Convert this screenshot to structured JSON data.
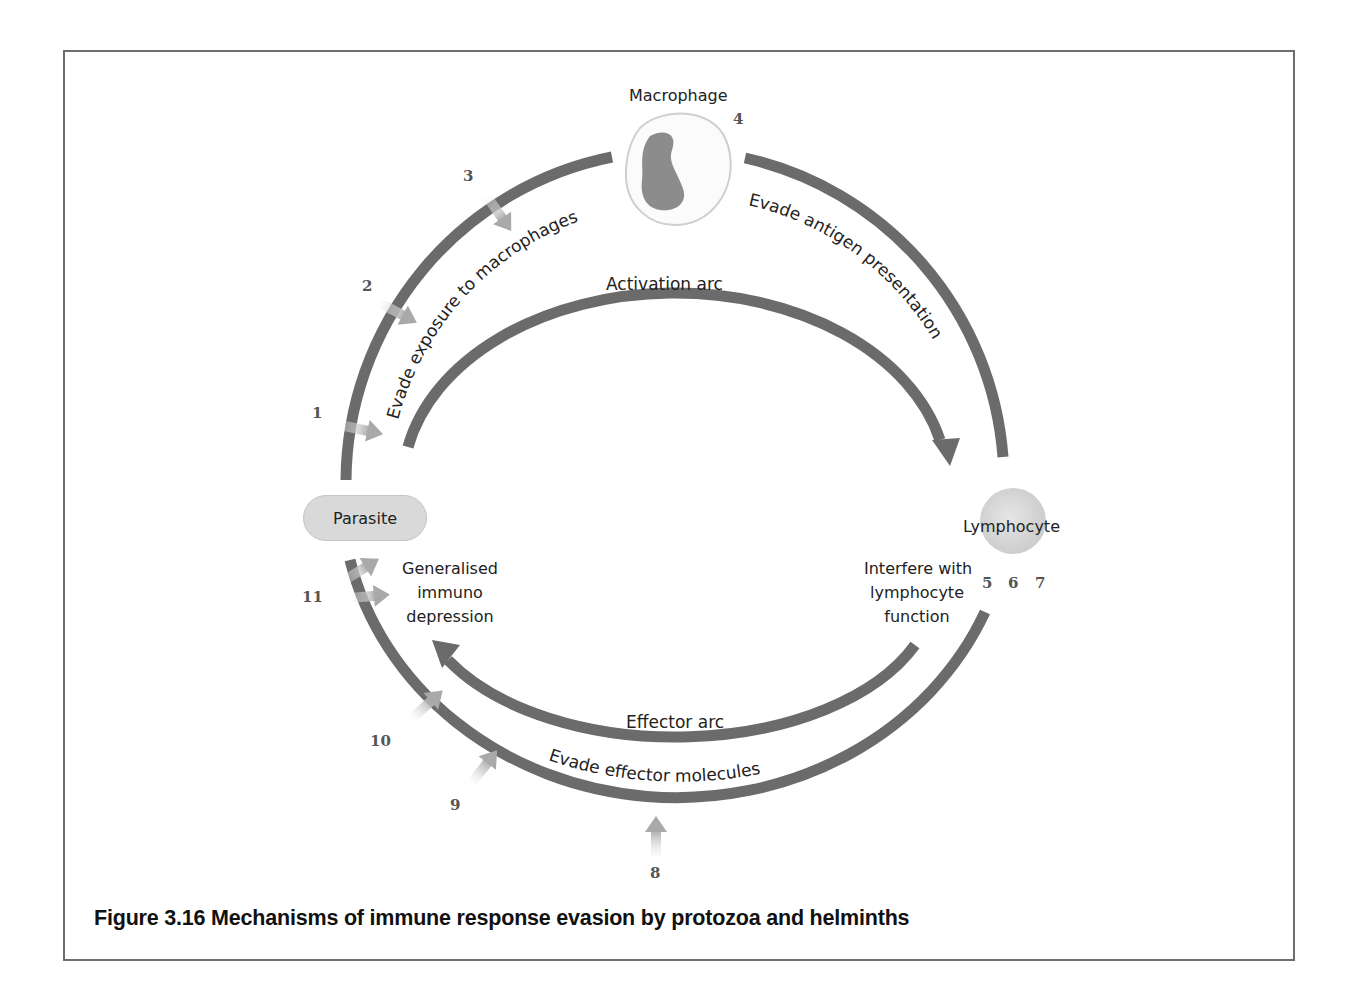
{
  "figure": {
    "caption": "Figure 3.16  Mechanisms of immune response evasion by protozoa and helminths"
  },
  "nodes": {
    "macrophage": "Macrophage",
    "parasite": "Parasite",
    "lymphocyte": "Lymphocyte"
  },
  "arcs": {
    "activation": "Activation arc",
    "effector": "Effector arc"
  },
  "evasion_labels": {
    "exposure": "Evade exposure to macrophages",
    "antigen": "Evade antigen presentation",
    "effector_molecules": "Evade effector molecules",
    "lymphocyte_line1": "Interfere with",
    "lymphocyte_line2": "lymphocyte",
    "lymphocyte_line3": "function",
    "immuno_line1": "Generalised",
    "immuno_line2": "immuno",
    "immuno_line3": "depression"
  },
  "mechanism_numbers": [
    "1",
    "2",
    "3",
    "4",
    "5",
    "6",
    "7",
    "8",
    "9",
    "10",
    "11"
  ],
  "colors": {
    "arc": "#6b6b6b",
    "cell_fill": "#d6d6d6",
    "border": "#6e6e6e",
    "callout_arrow": "#b8b8b8"
  }
}
